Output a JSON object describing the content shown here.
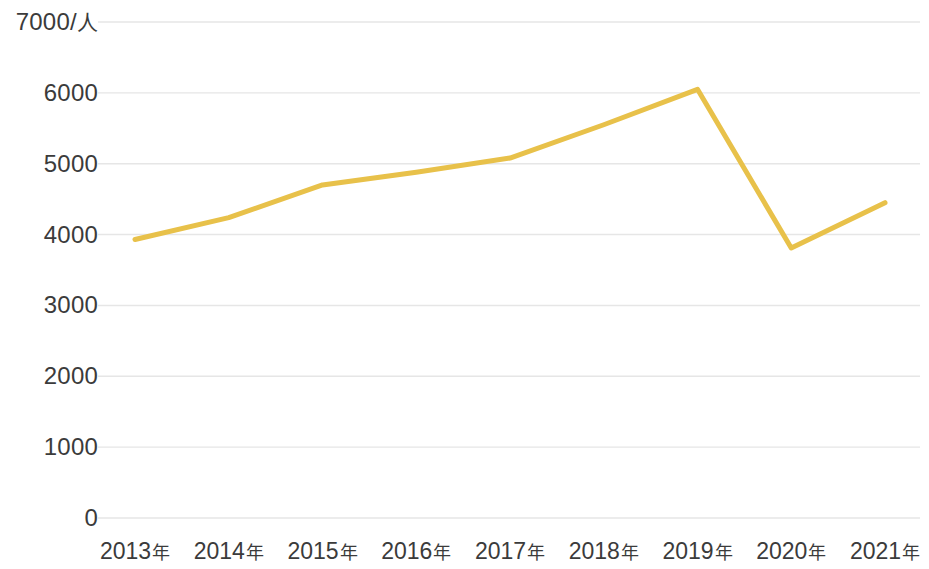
{
  "chart_data": {
    "type": "line",
    "title": "",
    "subtitle": "",
    "xlabel": "",
    "ylabel": "",
    "y_unit_label": "7000/人",
    "categories": [
      "2013年",
      "2014年",
      "2015年",
      "2016年",
      "2017年",
      "2018年",
      "2019年",
      "2020年",
      "2021年"
    ],
    "x": [
      2013,
      2014,
      2015,
      2016,
      2017,
      2018,
      2019,
      2020,
      2021
    ],
    "values": [
      3930,
      4240,
      4700,
      4880,
      5080,
      5550,
      6050,
      3810,
      4450
    ],
    "series": [
      {
        "name": "",
        "color": "#e8c14a",
        "values": [
          3930,
          4240,
          4700,
          4880,
          5080,
          5550,
          6050,
          3810,
          4450
        ]
      }
    ],
    "ylim": [
      0,
      7000
    ],
    "y_ticks": [
      0,
      1000,
      2000,
      3000,
      4000,
      5000,
      6000,
      7000
    ],
    "y_tick_labels": [
      "0",
      "1000",
      "2000",
      "3000",
      "4000",
      "5000",
      "6000",
      "7000/人"
    ],
    "grid": true,
    "grid_axis": "y",
    "grid_color": "#e6e6e6",
    "legend": false,
    "legend_position": "none",
    "markers": false,
    "line_width": 5,
    "background": "#ffffff",
    "text_color": "#3b3b3b",
    "annotations": []
  },
  "axis": {
    "y_labels": [
      {
        "text": "7000/",
        "unit": "人",
        "value": 7000
      },
      {
        "text": "6000",
        "unit": "",
        "value": 6000
      },
      {
        "text": "5000",
        "unit": "",
        "value": 5000
      },
      {
        "text": "4000",
        "unit": "",
        "value": 4000
      },
      {
        "text": "3000",
        "unit": "",
        "value": 3000
      },
      {
        "text": "2000",
        "unit": "",
        "value": 2000
      },
      {
        "text": "1000",
        "unit": "",
        "value": 1000
      },
      {
        "text": "0",
        "unit": "",
        "value": 0
      }
    ],
    "x_labels": [
      {
        "year": "2013",
        "suffix": "年"
      },
      {
        "year": "2014",
        "suffix": "年"
      },
      {
        "year": "2015",
        "suffix": "年"
      },
      {
        "year": "2016",
        "suffix": "年"
      },
      {
        "year": "2017",
        "suffix": "年"
      },
      {
        "year": "2018",
        "suffix": "年"
      },
      {
        "year": "2019",
        "suffix": "年"
      },
      {
        "year": "2020",
        "suffix": "年"
      },
      {
        "year": "2021",
        "suffix": "年"
      }
    ]
  }
}
